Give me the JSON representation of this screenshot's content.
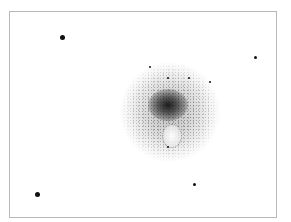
{
  "image": {
    "subject": "pencil sketch of a diffuse nebulous object with a dark central condensation and a hollow region below it, surrounded by field stars",
    "frame": {
      "border_color": "#b8b8b8",
      "background": "#ffffff"
    },
    "nucleus_color": "#1a1a1a",
    "stars": [
      {
        "x": 61,
        "y": 36,
        "size": 5
      },
      {
        "x": 254,
        "y": 56,
        "size": 3
      },
      {
        "x": 36,
        "y": 193,
        "size": 5
      },
      {
        "x": 193,
        "y": 183,
        "size": 3
      },
      {
        "x": 149,
        "y": 66,
        "size": 2
      },
      {
        "x": 167,
        "y": 77,
        "size": 2
      },
      {
        "x": 188,
        "y": 77,
        "size": 2
      },
      {
        "x": 209,
        "y": 81,
        "size": 2
      },
      {
        "x": 167,
        "y": 146,
        "size": 2
      }
    ]
  }
}
